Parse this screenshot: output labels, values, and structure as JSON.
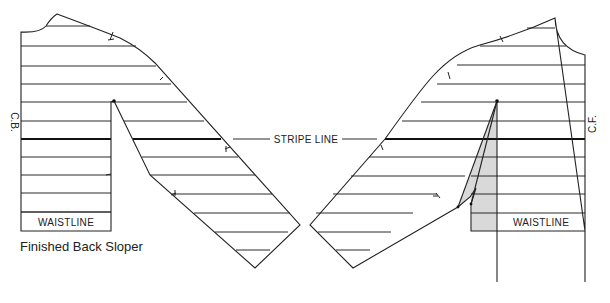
{
  "diagram": {
    "back_sloper": {
      "caption": "Finished Back Sloper",
      "center_label": "C.B.",
      "waistline_label": "WAISTLINE"
    },
    "front_sloper": {
      "center_label": "C.F.",
      "waistline_label": "WAISTLINE"
    },
    "stripe_line_label": "STRIPE LINE",
    "colors": {
      "line": "#222222",
      "shaded_dart": "#d9d9d9",
      "background": "#ffffff"
    }
  }
}
